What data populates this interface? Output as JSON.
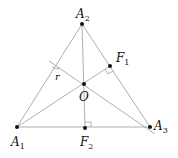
{
  "diagram": {
    "type": "geometry",
    "colors": {
      "line": "#9a9a9a",
      "point": "#111111",
      "text": "#111111"
    },
    "points": {
      "A1": {
        "x": 17,
        "y": 127,
        "label": "A",
        "sub": "1"
      },
      "A2": {
        "x": 82,
        "y": 24,
        "label": "A",
        "sub": "2"
      },
      "A3": {
        "x": 150,
        "y": 127,
        "label": "A",
        "sub": "3"
      },
      "O": {
        "x": 84,
        "y": 84,
        "label": "O"
      },
      "F1": {
        "x": 110,
        "y": 66,
        "label": "F",
        "sub": "1"
      },
      "F2": {
        "x": 85,
        "y": 128,
        "label": "F",
        "sub": "2"
      }
    },
    "segment_label": "r",
    "right_angles": [
      "F1",
      "F2"
    ]
  }
}
